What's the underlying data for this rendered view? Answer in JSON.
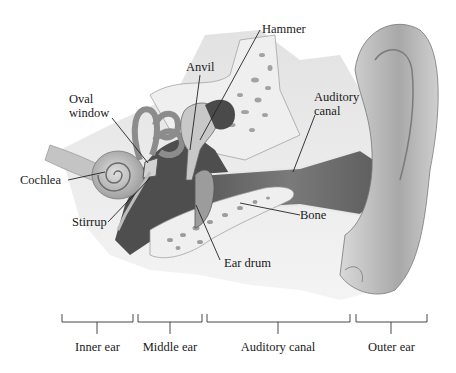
{
  "diagram": {
    "labels": {
      "hammer": "Hammer",
      "anvil": "Anvil",
      "oval_window_line1": "Oval",
      "oval_window_line2": "window",
      "auditory_canal_line1": "Auditory",
      "auditory_canal_line2": "canal",
      "cochlea": "Cochlea",
      "stirrup": "Stirrup",
      "bone": "Bone",
      "ear_drum": "Ear drum"
    },
    "sections": [
      {
        "label": "Inner ear"
      },
      {
        "label": "Middle ear"
      },
      {
        "label": "Auditory canal"
      },
      {
        "label": "Outer ear"
      }
    ],
    "colors": {
      "tissue_light": "#e6e6e6",
      "tissue_mid": "#b8b8b8",
      "tissue_dark": "#6e6e6e",
      "cavity_dark": "#4a4a4a",
      "bone_fill": "#eeeeee",
      "bone_spots": "#9a9a9a",
      "line": "#222222",
      "text": "#1a1a1a"
    }
  }
}
